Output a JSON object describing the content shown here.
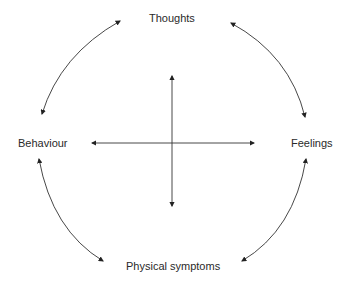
{
  "diagram": {
    "type": "cycle-with-cross",
    "nodes": {
      "top": "Thoughts",
      "left": "Behaviour",
      "right": "Feelings",
      "bottom": "Physical symptoms"
    },
    "edges": [
      {
        "from": "Thoughts",
        "to": "Behaviour",
        "style": "curved-bidirectional-arrow"
      },
      {
        "from": "Thoughts",
        "to": "Feelings",
        "style": "curved-bidirectional-arrow"
      },
      {
        "from": "Behaviour",
        "to": "Physical symptoms",
        "style": "curved-bidirectional-arrow"
      },
      {
        "from": "Feelings",
        "to": "Physical symptoms",
        "style": "curved-bidirectional-arrow"
      },
      {
        "from": "center",
        "to": "left/right",
        "style": "horizontal-bidirectional-arrow"
      },
      {
        "from": "center",
        "to": "up/down",
        "style": "vertical-bidirectional-arrow"
      }
    ],
    "colors": {
      "line": "#333333",
      "text": "#2a2a2a",
      "background": "#ffffff"
    }
  }
}
